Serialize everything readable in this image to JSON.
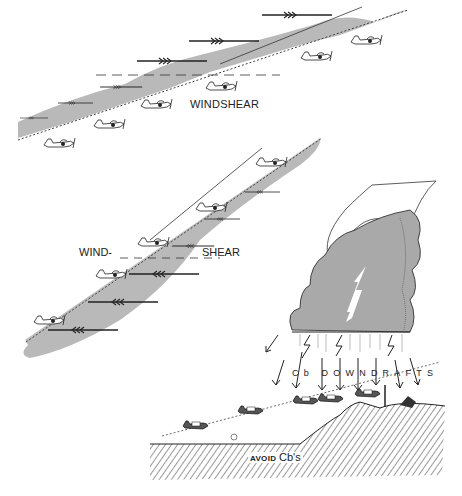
{
  "figure": {
    "panels": [
      {
        "id": "top-panel",
        "description": "Aircraft climbing out through a tailwind windshear layer",
        "label": "WINDSHEAR",
        "wind_arrow_direction": "right",
        "aircraft_count": 6
      },
      {
        "id": "middle-panel",
        "description": "Aircraft climbing into headwind, windshear layer boundary",
        "label_left": "WIND-",
        "label_right": "SHEAR",
        "wind_arrow_direction": "left",
        "aircraft_count": 4
      },
      {
        "id": "bottom-right-panel",
        "description": "Cumulonimbus cloud with downdrafts forcing descending aircraft into terrain",
        "downdraft_label": "Cb DOWNDRAFTS",
        "ground_label_small": "AVOID",
        "ground_label_big": "Cb's",
        "aircraft_count": 5
      }
    ],
    "colors": {
      "shear_layer_fill": "#b9b9b9",
      "cloud_fill": "#a9a9a9",
      "ink": "#1e1e1e",
      "background": "#ffffff"
    }
  }
}
